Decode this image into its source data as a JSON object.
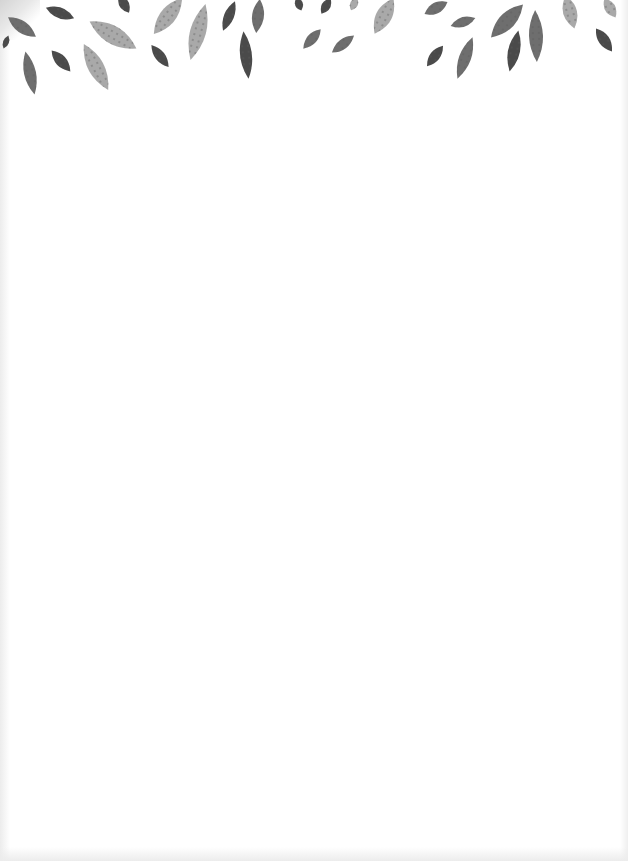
{
  "page": {
    "type": "blank decorative stationery",
    "background_color": "#ffffff",
    "text": ""
  },
  "decoration": {
    "motif": "falling-leaves-border",
    "position": "top-edge",
    "colors": {
      "dark": "#4a4a4a",
      "medium": "#6e6e6e",
      "light": "#a9a9a9",
      "dots": "#5a5a5a"
    },
    "leaves": [
      {
        "x": 22,
        "y": 27,
        "len": 34,
        "w": 12,
        "rot": 35,
        "shade": "medium"
      },
      {
        "x": 60,
        "y": 13,
        "len": 30,
        "w": 11,
        "rot": 20,
        "shade": "dark"
      },
      {
        "x": 30,
        "y": 73,
        "len": 44,
        "w": 12,
        "rot": 78,
        "shade": "medium"
      },
      {
        "x": 61,
        "y": 61,
        "len": 28,
        "w": 11,
        "rot": 48,
        "shade": "dark"
      },
      {
        "x": 113,
        "y": 35,
        "len": 54,
        "w": 18,
        "rot": 30,
        "shade": "light"
      },
      {
        "x": 96,
        "y": 67,
        "len": 52,
        "w": 16,
        "rot": 62,
        "shade": "light"
      },
      {
        "x": 124,
        "y": 4,
        "len": 20,
        "w": 10,
        "rot": 60,
        "shade": "dark"
      },
      {
        "x": 168,
        "y": 16,
        "len": 46,
        "w": 16,
        "rot": -52,
        "shade": "light"
      },
      {
        "x": 160,
        "y": 56,
        "len": 28,
        "w": 10,
        "rot": 52,
        "shade": "dark"
      },
      {
        "x": 198,
        "y": 32,
        "len": 58,
        "w": 16,
        "rot": -75,
        "shade": "light"
      },
      {
        "x": 229,
        "y": 16,
        "len": 32,
        "w": 10,
        "rot": -68,
        "shade": "dark"
      },
      {
        "x": 246,
        "y": 55,
        "len": 48,
        "w": 12,
        "rot": 84,
        "shade": "dark"
      },
      {
        "x": 258,
        "y": 16,
        "len": 34,
        "w": 12,
        "rot": 96,
        "shade": "medium"
      },
      {
        "x": 299,
        "y": 4,
        "len": 14,
        "w": 8,
        "rot": 70,
        "shade": "dark"
      },
      {
        "x": 326,
        "y": 6,
        "len": 18,
        "w": 9,
        "rot": -60,
        "shade": "dark"
      },
      {
        "x": 312,
        "y": 39,
        "len": 26,
        "w": 10,
        "rot": -48,
        "shade": "medium"
      },
      {
        "x": 343,
        "y": 44,
        "len": 28,
        "w": 10,
        "rot": -38,
        "shade": "medium"
      },
      {
        "x": 354,
        "y": 4,
        "len": 14,
        "w": 8,
        "rot": -65,
        "shade": "light"
      },
      {
        "x": 384,
        "y": 16,
        "len": 40,
        "w": 16,
        "rot": -62,
        "shade": "light"
      },
      {
        "x": 436,
        "y": 8,
        "len": 26,
        "w": 11,
        "rot": -28,
        "shade": "medium"
      },
      {
        "x": 463,
        "y": 22,
        "len": 26,
        "w": 10,
        "rot": -18,
        "shade": "medium"
      },
      {
        "x": 435,
        "y": 56,
        "len": 26,
        "w": 10,
        "rot": -52,
        "shade": "dark"
      },
      {
        "x": 465,
        "y": 58,
        "len": 44,
        "w": 12,
        "rot": -70,
        "shade": "medium"
      },
      {
        "x": 507,
        "y": 21,
        "len": 46,
        "w": 16,
        "rot": -46,
        "shade": "medium"
      },
      {
        "x": 514,
        "y": 51,
        "len": 42,
        "w": 12,
        "rot": -78,
        "shade": "dark"
      },
      {
        "x": 536,
        "y": 36,
        "len": 52,
        "w": 14,
        "rot": 88,
        "shade": "medium"
      },
      {
        "x": 570,
        "y": 12,
        "len": 34,
        "w": 14,
        "rot": 75,
        "shade": "light"
      },
      {
        "x": 604,
        "y": 40,
        "len": 28,
        "w": 11,
        "rot": 55,
        "shade": "dark"
      },
      {
        "x": 610,
        "y": 8,
        "len": 22,
        "w": 11,
        "rot": 60,
        "shade": "light"
      },
      {
        "x": 6,
        "y": 42,
        "len": 14,
        "w": 6,
        "rot": -70,
        "shade": "dark"
      }
    ]
  }
}
